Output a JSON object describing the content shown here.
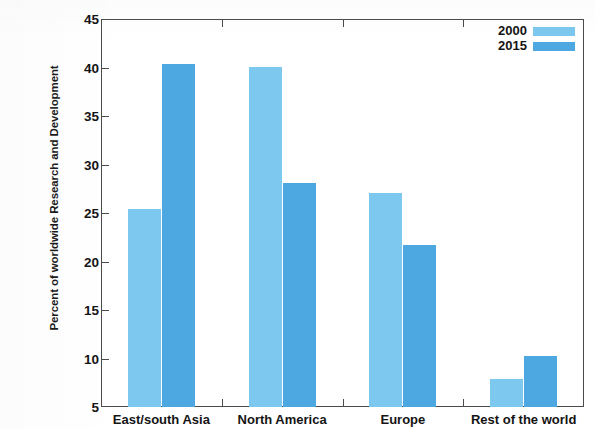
{
  "chart_data": {
    "type": "bar",
    "title": "",
    "xlabel": "",
    "ylabel": "Percent of worldwide Research and Development",
    "categories": [
      "East/south Asia",
      "North America",
      "Europe",
      "Rest of the world"
    ],
    "series": [
      {
        "name": "2000",
        "color": "#7cc8ef",
        "values": [
          25.4,
          40.1,
          27.1,
          7.9
        ]
      },
      {
        "name": "2015",
        "color": "#4da7e0",
        "values": [
          40.4,
          28.1,
          21.7,
          10.3
        ]
      }
    ],
    "ylim": [
      5,
      45
    ],
    "yticks": [
      5,
      10,
      15,
      20,
      25,
      30,
      35,
      40,
      45
    ],
    "ytick_labels": [
      "5",
      "10",
      "15",
      "20",
      "25",
      "30",
      "35",
      "40",
      "45"
    ],
    "grid": false,
    "legend_position": "top-right",
    "legend_entries": [
      "2000",
      "2015"
    ],
    "axis_color": "#4b4b4b",
    "background": "#ffffff"
  }
}
